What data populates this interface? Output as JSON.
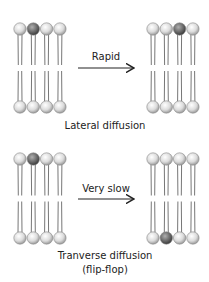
{
  "panels": [
    {
      "id": "lateral",
      "arrow_label": "Rapid",
      "caption_line1": "Lateral diffusion",
      "caption_line2": "",
      "left_membrane": {
        "top_highlight_index": 1,
        "bottom_highlight_index": -1
      },
      "right_membrane": {
        "top_highlight_index": 2,
        "bottom_highlight_index": -1
      }
    },
    {
      "id": "transverse",
      "arrow_label": "Very slow",
      "caption_line1": "Tranverse diffusion",
      "caption_line2": "(flip-flop)",
      "left_membrane": {
        "top_highlight_index": 1,
        "bottom_highlight_index": -1
      },
      "right_membrane": {
        "top_highlight_index": -1,
        "bottom_highlight_index": 1
      }
    }
  ],
  "colors": {
    "head_light": "#e6e6e6",
    "head_dark": "#6e6e6e",
    "tail": "#777777",
    "arrow": "#222222"
  }
}
